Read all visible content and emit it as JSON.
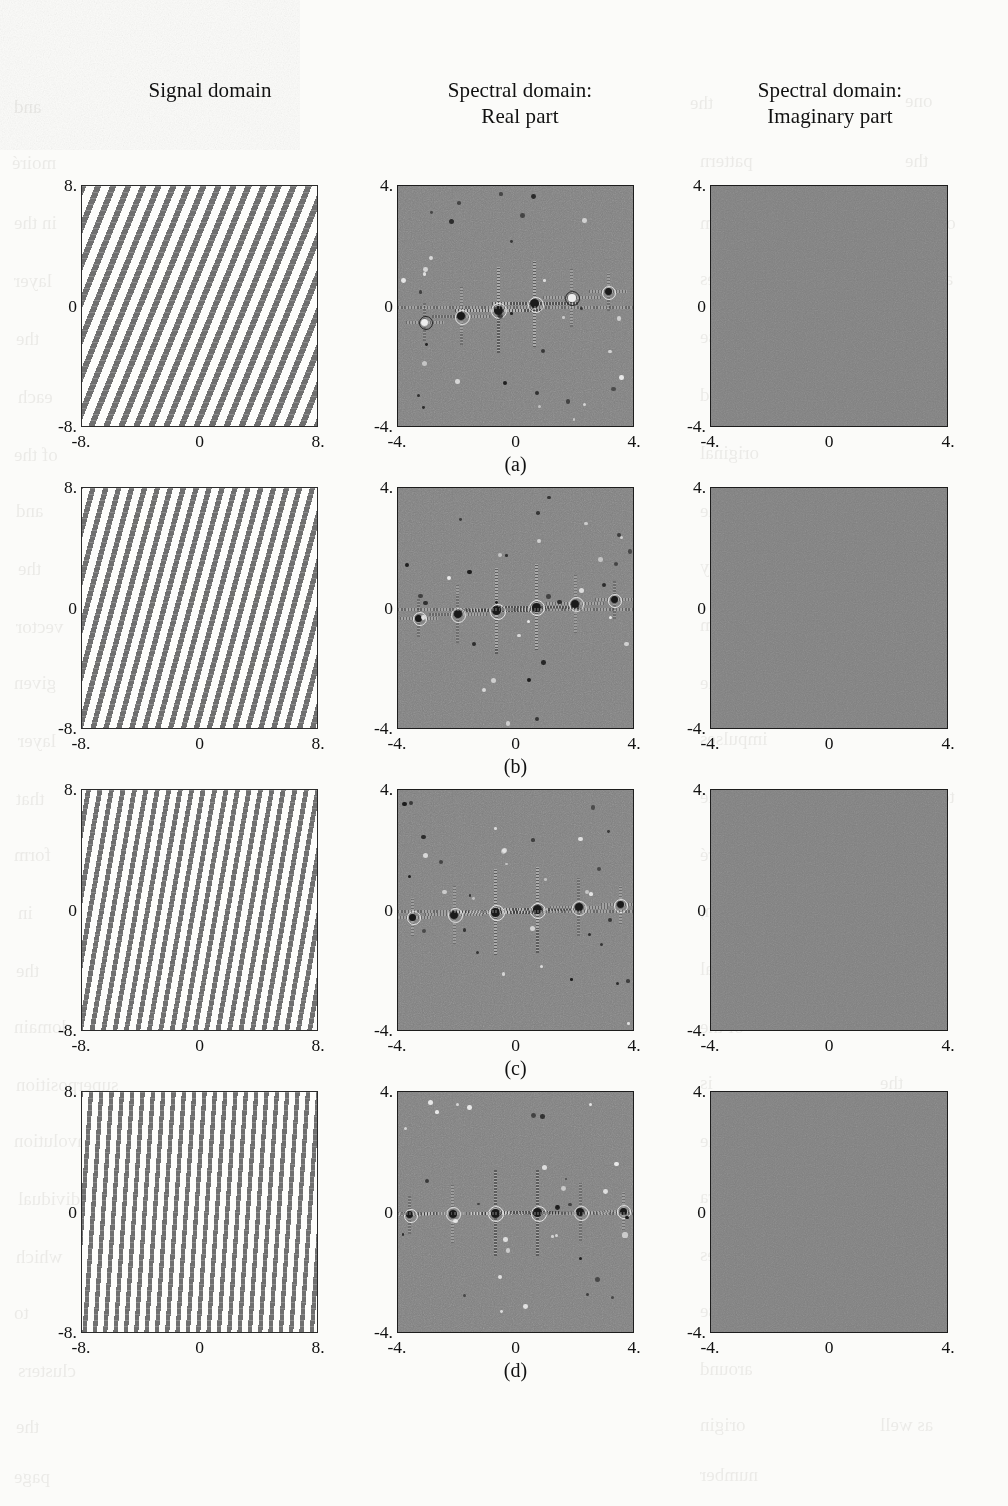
{
  "figure": {
    "column_headers": [
      {
        "name": "signal-domain",
        "line1": "Signal domain",
        "line2": ""
      },
      {
        "name": "spectral-real",
        "line1": "Spectral domain:",
        "line2": "Real part"
      },
      {
        "name": "spectral-imaginary",
        "line1": "Spectral domain:",
        "line2": "Imaginary part"
      }
    ],
    "row_captions": [
      "(a)",
      "(b)",
      "(c)",
      "(d)"
    ],
    "signal_axis": {
      "y_top": "8.",
      "y_mid": "0",
      "y_bottom": "-8.",
      "x_left": "-8.",
      "x_mid": "0",
      "x_right": "8."
    },
    "spectral_axis": {
      "y_top": "4.",
      "y_mid": "0",
      "y_bottom": "-4.",
      "x_left": "-4.",
      "x_mid": "0",
      "x_right": "4."
    },
    "colors": {
      "grating_bar": "#6f6f6f",
      "grating_background": "#fdfdfb",
      "spectral_background": "#808080",
      "impulse_dark": "#1a1a1a",
      "impulse_light": "#ededed",
      "frame": "#2b2b2b",
      "page": "#fbfbf9"
    }
  },
  "chart_data": {
    "type": "heatmap",
    "title": "",
    "columns": [
      "Signal domain",
      "Spectral domain: Real part",
      "Spectral domain: Imaginary part"
    ],
    "rows": [
      "(a)",
      "(b)",
      "(c)",
      "(d)"
    ],
    "signal_axis_range": {
      "x": [
        -8,
        8
      ],
      "y": [
        -8,
        8
      ],
      "ticks": [
        -8,
        0,
        8
      ]
    },
    "spectral_axis_range": {
      "x": [
        -4,
        4
      ],
      "y": [
        -4,
        4
      ],
      "ticks": [
        -4,
        0,
        4
      ]
    },
    "grid": false,
    "legend": "none",
    "series": [
      {
        "name": "(a)",
        "stripe_tilt_deg_from_vertical": 22,
        "stripe_count": 17,
        "stripe_period_units": 0.95,
        "imaginary_part": 0,
        "spectral_impulses": [
          {
            "fx": -0.62,
            "fy": -0.1,
            "sign": "dark",
            "order": 1
          },
          {
            "fx": 0.62,
            "fy": 0.1,
            "sign": "dark",
            "order": 1
          },
          {
            "fx": -1.86,
            "fy": -0.3,
            "sign": "dark",
            "order": 3
          },
          {
            "fx": 1.86,
            "fy": 0.3,
            "sign": "light",
            "order": 3
          },
          {
            "fx": -3.1,
            "fy": -0.5,
            "sign": "light",
            "order": 5
          },
          {
            "fx": 3.1,
            "fy": 0.5,
            "sign": "dark",
            "order": 5
          }
        ]
      },
      {
        "name": "(b)",
        "stripe_tilt_deg_from_vertical": 15,
        "stripe_count": 19,
        "stripe_period_units": 0.85,
        "imaginary_part": 0,
        "spectral_impulses": [
          {
            "fx": -0.66,
            "fy": -0.06,
            "sign": "dark",
            "order": 1
          },
          {
            "fx": 0.66,
            "fy": 0.06,
            "sign": "dark",
            "order": 1
          },
          {
            "fx": -1.98,
            "fy": -0.18,
            "sign": "dark",
            "order": 3
          },
          {
            "fx": 1.98,
            "fy": 0.18,
            "sign": "dark",
            "order": 3
          },
          {
            "fx": -3.3,
            "fy": -0.3,
            "sign": "dark",
            "order": 5
          },
          {
            "fx": 3.3,
            "fy": 0.3,
            "sign": "dark",
            "order": 5
          }
        ]
      },
      {
        "name": "(c)",
        "stripe_tilt_deg_from_vertical": 10,
        "stripe_count": 21,
        "stripe_period_units": 0.78,
        "imaginary_part": 0,
        "spectral_impulses": [
          {
            "fx": -0.7,
            "fy": -0.04,
            "sign": "dark",
            "order": 1
          },
          {
            "fx": 0.7,
            "fy": 0.04,
            "sign": "dark",
            "order": 1
          },
          {
            "fx": -2.1,
            "fy": -0.12,
            "sign": "dark",
            "order": 3
          },
          {
            "fx": 2.1,
            "fy": 0.12,
            "sign": "dark",
            "order": 3
          },
          {
            "fx": -3.5,
            "fy": -0.2,
            "sign": "dark",
            "order": 5
          },
          {
            "fx": 3.5,
            "fy": 0.2,
            "sign": "dark",
            "order": 5
          }
        ]
      },
      {
        "name": "(d)",
        "stripe_tilt_deg_from_vertical": 4,
        "stripe_count": 23,
        "stripe_period_units": 0.7,
        "imaginary_part": 0,
        "spectral_impulses": [
          {
            "fx": -0.72,
            "fy": -0.01,
            "sign": "dark",
            "order": 1
          },
          {
            "fx": 0.72,
            "fy": 0.01,
            "sign": "dark",
            "order": 1
          },
          {
            "fx": -2.16,
            "fy": -0.03,
            "sign": "dark",
            "order": 3
          },
          {
            "fx": 2.16,
            "fy": 0.03,
            "sign": "dark",
            "order": 3
          },
          {
            "fx": -3.6,
            "fy": -0.05,
            "sign": "dark",
            "order": 5
          },
          {
            "fx": 3.6,
            "fy": 0.05,
            "sign": "dark",
            "order": 5
          }
        ]
      }
    ]
  },
  "ghost_text": [
    {
      "t": "and",
      "x": 14,
      "y": 96,
      "s": 19
    },
    {
      "t": "the",
      "x": 690,
      "y": 92,
      "s": 19
    },
    {
      "t": "one",
      "x": 905,
      "y": 90,
      "s": 19
    },
    {
      "t": "moiré",
      "x": 12,
      "y": 152,
      "s": 19
    },
    {
      "t": "pattern",
      "x": 700,
      "y": 150,
      "s": 19
    },
    {
      "t": "the",
      "x": 905,
      "y": 150,
      "s": 19
    },
    {
      "t": "in the",
      "x": 14,
      "y": 212,
      "s": 19
    },
    {
      "t": "spectrum",
      "x": 700,
      "y": 212,
      "s": 19
    },
    {
      "t": "of",
      "x": 940,
      "y": 212,
      "s": 19
    },
    {
      "t": "layer",
      "x": 14,
      "y": 270,
      "s": 19
    },
    {
      "t": "values",
      "x": 700,
      "y": 268,
      "s": 19
    },
    {
      "t": "are",
      "x": 930,
      "y": 268,
      "s": 19
    },
    {
      "t": "the",
      "x": 16,
      "y": 328,
      "s": 19
    },
    {
      "t": "impulse",
      "x": 700,
      "y": 326,
      "s": 19
    },
    {
      "t": "each",
      "x": 18,
      "y": 386,
      "s": 19
    },
    {
      "t": "located",
      "x": 700,
      "y": 384,
      "s": 19
    },
    {
      "t": "at",
      "x": 930,
      "y": 384,
      "s": 19
    },
    {
      "t": "of the",
      "x": 14,
      "y": 444,
      "s": 19
    },
    {
      "t": "original",
      "x": 700,
      "y": 442,
      "s": 19
    },
    {
      "t": "and",
      "x": 16,
      "y": 500,
      "s": 19
    },
    {
      "t": "the",
      "x": 700,
      "y": 500,
      "s": 19
    },
    {
      "t": "same",
      "x": 880,
      "y": 500,
      "s": 19
    },
    {
      "t": "the",
      "x": 18,
      "y": 558,
      "s": 19
    },
    {
      "t": "frequency",
      "x": 700,
      "y": 556,
      "s": 19
    },
    {
      "t": "vector",
      "x": 16,
      "y": 616,
      "s": 19
    },
    {
      "t": "sum",
      "x": 700,
      "y": 614,
      "s": 19
    },
    {
      "t": "is",
      "x": 900,
      "y": 614,
      "s": 19
    },
    {
      "t": "given",
      "x": 14,
      "y": 672,
      "s": 19
    },
    {
      "t": "by the",
      "x": 700,
      "y": 672,
      "s": 19
    },
    {
      "t": "layer",
      "x": 18,
      "y": 730,
      "s": 19
    },
    {
      "t": "impulses",
      "x": 700,
      "y": 728,
      "s": 19
    },
    {
      "t": "that",
      "x": 16,
      "y": 788,
      "s": 19
    },
    {
      "t": "combine",
      "x": 700,
      "y": 786,
      "s": 19
    },
    {
      "t": "to",
      "x": 940,
      "y": 786,
      "s": 19
    },
    {
      "t": "form",
      "x": 14,
      "y": 844,
      "s": 19
    },
    {
      "t": "the moiré",
      "x": 700,
      "y": 844,
      "s": 19
    },
    {
      "t": "in",
      "x": 18,
      "y": 902,
      "s": 19
    },
    {
      "t": "question,",
      "x": 700,
      "y": 900,
      "s": 19
    },
    {
      "t": "the",
      "x": 16,
      "y": 960,
      "s": 19
    },
    {
      "t": "spectral",
      "x": 700,
      "y": 958,
      "s": 19
    },
    {
      "t": "domain",
      "x": 14,
      "y": 1016,
      "s": 19
    },
    {
      "t": "of the",
      "x": 700,
      "y": 1016,
      "s": 19
    },
    {
      "t": "superposition",
      "x": 16,
      "y": 1074,
      "s": 19
    },
    {
      "t": "is",
      "x": 700,
      "y": 1072,
      "s": 19
    },
    {
      "t": "the",
      "x": 880,
      "y": 1072,
      "s": 19
    },
    {
      "t": "convolution",
      "x": 14,
      "y": 1130,
      "s": 19
    },
    {
      "t": "of the",
      "x": 700,
      "y": 1130,
      "s": 19
    },
    {
      "t": "individual",
      "x": 18,
      "y": 1188,
      "s": 19
    },
    {
      "t": "spectra",
      "x": 700,
      "y": 1186,
      "s": 19
    },
    {
      "t": "which",
      "x": 16,
      "y": 1246,
      "s": 19
    },
    {
      "t": "gives",
      "x": 700,
      "y": 1244,
      "s": 19
    },
    {
      "t": "rise",
      "x": 900,
      "y": 1244,
      "s": 19
    },
    {
      "t": "to",
      "x": 14,
      "y": 1302,
      "s": 19
    },
    {
      "t": "impulse",
      "x": 700,
      "y": 1300,
      "s": 19
    },
    {
      "t": "clusters",
      "x": 18,
      "y": 1360,
      "s": 19
    },
    {
      "t": "around",
      "x": 700,
      "y": 1358,
      "s": 19
    },
    {
      "t": "the",
      "x": 16,
      "y": 1416,
      "s": 19
    },
    {
      "t": "origin",
      "x": 700,
      "y": 1414,
      "s": 19
    },
    {
      "t": "as well",
      "x": 880,
      "y": 1414,
      "s": 19
    },
    {
      "t": "page",
      "x": 14,
      "y": 1466,
      "s": 19
    },
    {
      "t": "number",
      "x": 700,
      "y": 1464,
      "s": 19
    }
  ]
}
